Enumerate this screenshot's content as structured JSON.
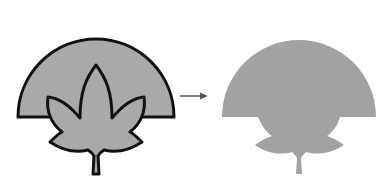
{
  "diagram": {
    "colors": {
      "fill_left": "#a9a9a9",
      "stroke_left": "#111111",
      "fill_right": "#a2a2a2",
      "arrow": "#555555",
      "background": "#ffffff"
    },
    "left_figure": {
      "shapes": [
        "dome",
        "leaf"
      ],
      "outlined": true
    },
    "arrow": {
      "direction": "right"
    },
    "right_figure": {
      "shapes": [
        "merged-silhouette"
      ],
      "outlined": false
    }
  }
}
